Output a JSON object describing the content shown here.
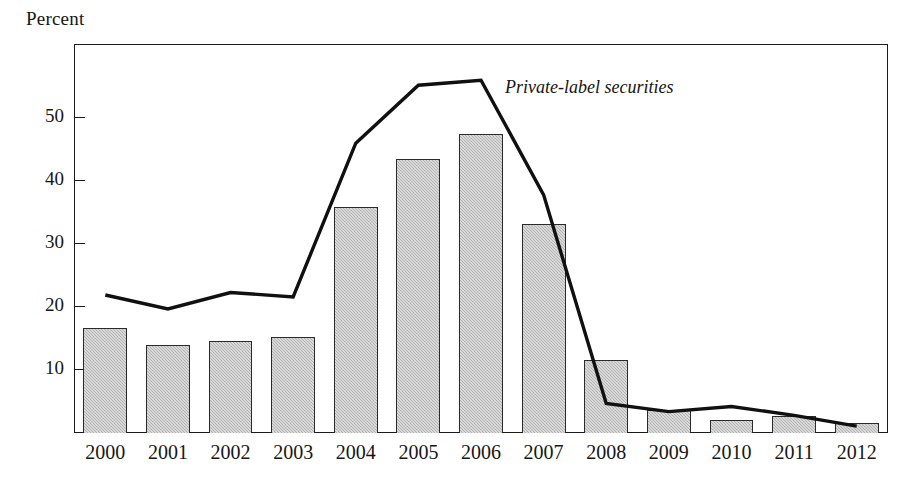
{
  "axis": {
    "y_caption": "Percent",
    "y_ticks": [
      10,
      20,
      30,
      40,
      50
    ],
    "y_tick_labels": [
      "10",
      "20",
      "30",
      "40",
      "50"
    ],
    "x_tick_labels": [
      "2000",
      "2001",
      "2002",
      "2003",
      "2004",
      "2005",
      "2006",
      "2007",
      "2008",
      "2009",
      "2010",
      "2011",
      "2012"
    ]
  },
  "annotation": {
    "series_label": "Private-label securities"
  },
  "colors": {
    "bar_fill": "#bdbdbd",
    "bar_border": "#2a2a2a",
    "line": "#101010",
    "frame": "#1b1b1b",
    "text": "#161616",
    "background": "#ffffff"
  },
  "chart_data": {
    "type": "bar",
    "title": "",
    "subtitle": "",
    "xlabel": "",
    "ylabel": "Percent",
    "ylim": [
      0,
      61.7
    ],
    "xlim_categories": 13,
    "grid": false,
    "legend": "inline-annotation",
    "categories": [
      "2000",
      "2001",
      "2002",
      "2003",
      "2004",
      "2005",
      "2006",
      "2007",
      "2008",
      "2009",
      "2010",
      "2011",
      "2012"
    ],
    "series": [
      {
        "name": "Bars",
        "type": "bar",
        "values": [
          16.7,
          13.9,
          14.6,
          15.2,
          35.9,
          43.5,
          47.5,
          33.1,
          11.6,
          3.7,
          2.1,
          2.7,
          1.6
        ]
      },
      {
        "name": "Private-label securities",
        "type": "line",
        "values": [
          21.9,
          19.7,
          22.3,
          21.6,
          46.0,
          55.2,
          56.0,
          37.8,
          4.7,
          3.4,
          4.2,
          2.8,
          1.1
        ]
      }
    ]
  }
}
